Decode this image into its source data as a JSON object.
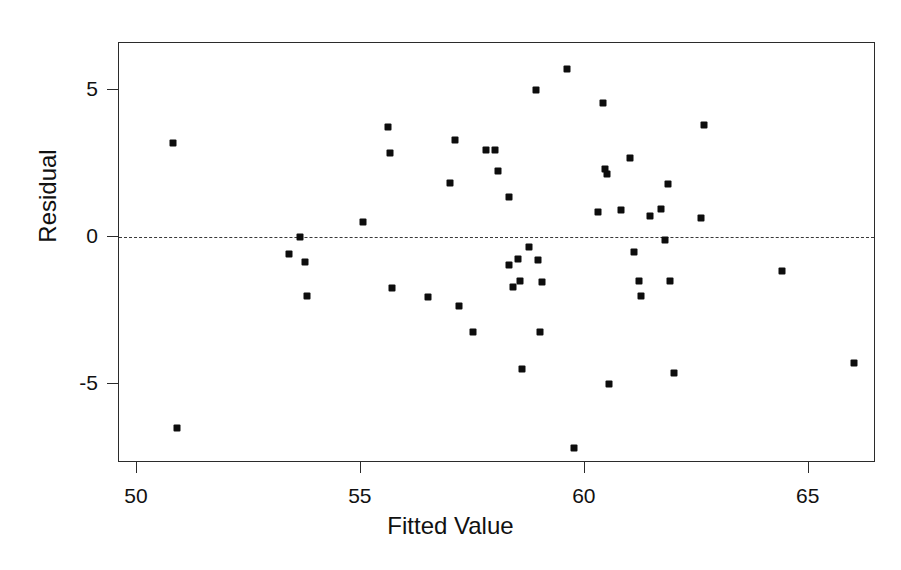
{
  "figure": {
    "title_artifact": "",
    "background_color": "#ffffff",
    "point_color": "#0d0d0d",
    "axis_color": "#2b2b2b",
    "reference_line_color": "#3a3a3a"
  },
  "axes": {
    "xlabel": "Fitted Value",
    "ylabel": "Residual",
    "x_ticks": [
      "50",
      "55",
      "60",
      "65"
    ],
    "y_ticks": [
      "5",
      "0",
      "-5"
    ],
    "xlim": [
      49.6,
      66.5
    ],
    "ylim": [
      -7.7,
      6.6
    ],
    "reference_line_y": 0
  },
  "chart_data": {
    "type": "scatter",
    "title": "",
    "xlabel": "Fitted Value",
    "ylabel": "Residual",
    "xlim": [
      49.6,
      66.5
    ],
    "ylim": [
      -7.7,
      6.6
    ],
    "xticks": [
      50,
      55,
      60,
      65
    ],
    "yticks": [
      -5,
      0,
      5
    ],
    "grid": false,
    "legend": null,
    "reference_lines": [
      {
        "orientation": "horizontal",
        "value": 0,
        "style": "dashed"
      }
    ],
    "series": [
      {
        "name": "Residuals",
        "marker": "square",
        "color": "#0d0d0d",
        "points": [
          [
            50.8,
            3.2
          ],
          [
            50.9,
            -6.5
          ],
          [
            53.4,
            -0.6
          ],
          [
            53.65,
            0.0
          ],
          [
            53.75,
            -0.85
          ],
          [
            53.8,
            -2.0
          ],
          [
            55.05,
            0.5
          ],
          [
            55.6,
            3.75
          ],
          [
            55.65,
            2.85
          ],
          [
            55.7,
            -1.75
          ],
          [
            56.5,
            -2.05
          ],
          [
            57.0,
            1.85
          ],
          [
            57.1,
            3.3
          ],
          [
            57.2,
            -2.35
          ],
          [
            57.5,
            -3.25
          ],
          [
            57.8,
            2.95
          ],
          [
            58.0,
            2.95
          ],
          [
            58.05,
            2.25
          ],
          [
            58.3,
            1.35
          ],
          [
            58.3,
            -0.95
          ],
          [
            58.4,
            -1.7
          ],
          [
            58.5,
            -0.75
          ],
          [
            58.55,
            -1.5
          ],
          [
            58.6,
            -4.5
          ],
          [
            58.75,
            -0.35
          ],
          [
            58.9,
            5.0
          ],
          [
            58.95,
            -0.8
          ],
          [
            59.0,
            -3.25
          ],
          [
            59.05,
            -1.55
          ],
          [
            59.6,
            5.7
          ],
          [
            59.75,
            -7.2
          ],
          [
            60.3,
            0.85
          ],
          [
            60.4,
            4.55
          ],
          [
            60.45,
            2.3
          ],
          [
            60.5,
            2.15
          ],
          [
            60.55,
            -5.0
          ],
          [
            60.8,
            0.9
          ],
          [
            61.0,
            2.7
          ],
          [
            61.1,
            -0.5
          ],
          [
            61.2,
            -1.5
          ],
          [
            61.25,
            -2.0
          ],
          [
            61.45,
            0.7
          ],
          [
            61.7,
            0.95
          ],
          [
            61.8,
            -0.1
          ],
          [
            61.85,
            1.8
          ],
          [
            61.9,
            -1.5
          ],
          [
            62.0,
            -4.65
          ],
          [
            62.6,
            0.65
          ],
          [
            62.65,
            3.8
          ],
          [
            64.4,
            -1.15
          ],
          [
            66.0,
            -4.3
          ]
        ]
      }
    ]
  }
}
